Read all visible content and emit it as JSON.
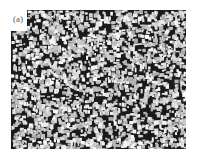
{
  "figure": {
    "panel_label": "(a)",
    "colors": {
      "background": "#ffffff",
      "grain_bright": "#f0f0f0",
      "matrix_dark": "#1a1a1a",
      "label": "#555555"
    }
  }
}
